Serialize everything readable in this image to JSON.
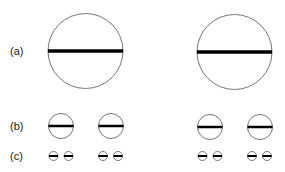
{
  "labels": {
    "a": "(a)",
    "b": "(b)",
    "c": "(c)"
  },
  "colors": {
    "outline": "#777777",
    "bar": "#000000",
    "text": "#222222"
  },
  "rows": [
    {
      "id": "a",
      "radius": 37.5,
      "bar_width": 3.5,
      "circles": [
        {
          "cx": 85.5,
          "cy": 51
        },
        {
          "cx": 234.5,
          "cy": 52
        }
      ]
    },
    {
      "id": "b",
      "radius": 12.5,
      "bar_width": 2.5,
      "circles": [
        {
          "cx": 61,
          "cy": 126
        },
        {
          "cx": 111,
          "cy": 126
        },
        {
          "cx": 210,
          "cy": 127
        },
        {
          "cx": 260,
          "cy": 127
        }
      ]
    },
    {
      "id": "c",
      "radius": 4.5,
      "bar_width": 2,
      "circles": [
        {
          "cx": 53.5,
          "cy": 156
        },
        {
          "cx": 68.5,
          "cy": 156
        },
        {
          "cx": 103,
          "cy": 156
        },
        {
          "cx": 118,
          "cy": 156
        },
        {
          "cx": 202.5,
          "cy": 156
        },
        {
          "cx": 217.5,
          "cy": 156
        },
        {
          "cx": 252,
          "cy": 156
        },
        {
          "cx": 267,
          "cy": 156
        }
      ]
    }
  ]
}
